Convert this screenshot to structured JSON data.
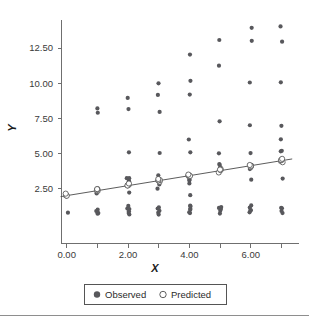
{
  "chart_data": {
    "type": "scatter",
    "title": "",
    "xlabel": "X",
    "ylabel": "Y",
    "xlim": [
      -0.35,
      7.45
    ],
    "ylim": [
      0.0,
      14.6
    ],
    "xticks": [
      0,
      1,
      2,
      3,
      4,
      5,
      6,
      7
    ],
    "xtick_labels": [
      "0.00",
      "",
      "2.00",
      "",
      "4.00",
      "",
      "6.00",
      ""
    ],
    "yticks": [
      2.5,
      5.0,
      7.5,
      10.0,
      12.5
    ],
    "ytick_labels": [
      "2.50",
      "5.00",
      "7.50",
      "10.00",
      "12.50"
    ],
    "grid": false,
    "legend_position": "bottom",
    "legend": [
      {
        "label": "Observed",
        "marker": "filled-circle",
        "color": "#58585c"
      },
      {
        "label": "Predicted",
        "marker": "open-circle",
        "color": "#ffffff"
      }
    ],
    "fit_line": {
      "intercept": 2.0,
      "slope": 0.355,
      "x_start": -0.2,
      "x_end": 7.35,
      "color": "#4a4a4a"
    },
    "series": [
      {
        "name": "Observed",
        "marker": "filled-circle",
        "color": "#58585c",
        "points": [
          [
            0,
            0.72
          ],
          [
            0,
            2.05
          ],
          [
            0,
            2.08
          ],
          [
            0,
            2.02
          ],
          [
            0,
            2.12
          ],
          [
            1,
            0.72
          ],
          [
            1,
            0.78
          ],
          [
            1,
            0.85
          ],
          [
            1,
            0.92
          ],
          [
            1,
            1.0
          ],
          [
            1,
            2.18
          ],
          [
            1,
            2.3
          ],
          [
            1,
            2.42
          ],
          [
            1,
            2.2
          ],
          [
            1,
            7.95
          ],
          [
            1,
            8.2
          ],
          [
            2,
            0.7
          ],
          [
            2,
            0.8
          ],
          [
            2,
            0.9
          ],
          [
            2,
            1.0
          ],
          [
            2,
            1.1
          ],
          [
            2,
            1.2
          ],
          [
            2,
            2.15
          ],
          [
            2,
            2.75
          ],
          [
            2,
            3.1
          ],
          [
            2,
            3.2
          ],
          [
            2,
            3.25
          ],
          [
            2,
            3.0
          ],
          [
            2,
            5.1
          ],
          [
            2,
            8.15
          ],
          [
            2,
            9.0
          ],
          [
            3,
            0.72
          ],
          [
            3,
            0.82
          ],
          [
            3,
            0.95
          ],
          [
            3,
            1.05
          ],
          [
            3,
            1.15
          ],
          [
            3,
            2.55
          ],
          [
            3,
            2.8
          ],
          [
            3,
            2.95
          ],
          [
            3,
            3.05
          ],
          [
            3,
            3.15
          ],
          [
            3,
            3.5
          ],
          [
            3,
            5.1
          ],
          [
            3,
            8.0
          ],
          [
            3,
            9.2
          ],
          [
            3,
            10.05
          ],
          [
            4,
            0.72
          ],
          [
            4,
            0.85
          ],
          [
            4,
            0.95
          ],
          [
            4,
            1.1
          ],
          [
            4,
            1.2
          ],
          [
            4,
            1.3
          ],
          [
            4,
            2.0
          ],
          [
            4,
            2.9
          ],
          [
            4,
            3.0
          ],
          [
            4,
            3.1
          ],
          [
            4,
            3.25
          ],
          [
            4,
            3.4
          ],
          [
            4,
            5.15
          ],
          [
            4,
            6.05
          ],
          [
            4,
            9.2
          ],
          [
            4,
            10.2
          ],
          [
            4,
            12.1
          ],
          [
            5,
            0.75
          ],
          [
            5,
            0.88
          ],
          [
            5,
            1.0
          ],
          [
            5,
            1.12
          ],
          [
            5,
            1.25
          ],
          [
            5,
            3.7
          ],
          [
            5,
            3.9
          ],
          [
            5,
            4.0
          ],
          [
            5,
            4.15
          ],
          [
            5,
            4.25
          ],
          [
            5,
            5.0
          ],
          [
            5,
            7.35
          ],
          [
            5,
            11.2
          ],
          [
            5,
            13.05
          ],
          [
            6,
            0.78
          ],
          [
            6,
            0.9
          ],
          [
            6,
            1.02
          ],
          [
            6,
            1.15
          ],
          [
            6,
            1.28
          ],
          [
            6,
            3.2
          ],
          [
            6,
            3.95
          ],
          [
            6,
            4.05
          ],
          [
            6,
            4.15
          ],
          [
            6,
            5.1
          ],
          [
            6,
            6.95
          ],
          [
            6,
            10.0
          ],
          [
            6,
            12.95
          ],
          [
            6,
            13.95
          ],
          [
            7,
            0.78
          ],
          [
            7,
            0.92
          ],
          [
            7,
            1.05
          ],
          [
            7,
            1.18
          ],
          [
            7,
            3.2
          ],
          [
            7,
            4.35
          ],
          [
            7,
            4.45
          ],
          [
            7,
            4.6
          ],
          [
            7,
            5.1
          ],
          [
            7,
            5.25
          ],
          [
            7,
            6.05
          ],
          [
            7,
            6.95
          ],
          [
            7,
            10.1
          ],
          [
            7,
            12.95
          ],
          [
            7,
            14.1
          ]
        ]
      },
      {
        "name": "Predicted",
        "marker": "open-circle",
        "color": "#ffffff",
        "points": [
          [
            0,
            1.98
          ],
          [
            0,
            2.02
          ],
          [
            0,
            2.06
          ],
          [
            0,
            2.1
          ],
          [
            1,
            2.3
          ],
          [
            1,
            2.35
          ],
          [
            1,
            2.4
          ],
          [
            1,
            2.45
          ],
          [
            2,
            2.68
          ],
          [
            2,
            2.72
          ],
          [
            2,
            2.76
          ],
          [
            2,
            2.8
          ],
          [
            3,
            3.0
          ],
          [
            3,
            3.05
          ],
          [
            3,
            3.1
          ],
          [
            3,
            3.15
          ],
          [
            4,
            3.35
          ],
          [
            4,
            3.4
          ],
          [
            4,
            3.45
          ],
          [
            4,
            3.5
          ],
          [
            5,
            3.7
          ],
          [
            5,
            3.76
          ],
          [
            5,
            3.82
          ],
          [
            5,
            3.88
          ],
          [
            6,
            4.05
          ],
          [
            6,
            4.1
          ],
          [
            6,
            4.16
          ],
          [
            6,
            4.22
          ],
          [
            7,
            4.4
          ],
          [
            7,
            4.46
          ],
          [
            7,
            4.52
          ],
          [
            7,
            4.58
          ]
        ]
      }
    ]
  },
  "axes": {
    "y_title": "Y",
    "x_title": "X"
  },
  "legend": {
    "observed_label": "Observed",
    "predicted_label": "Predicted"
  }
}
